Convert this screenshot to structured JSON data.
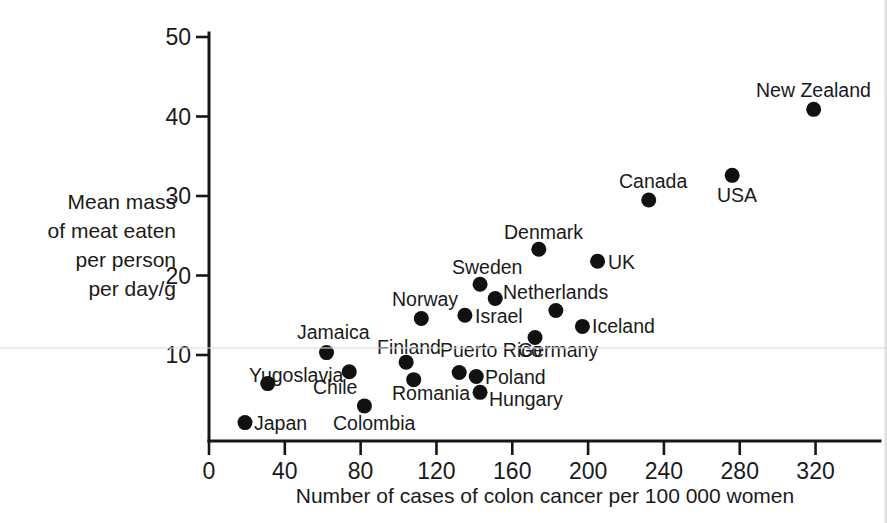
{
  "chart_data": {
    "type": "scatter",
    "title": "",
    "xlabel": "Number of cases of colon cancer per 100 000 women",
    "ylabel": "Mean mass of meat eaten per person per day/g",
    "ylabel_lines": [
      "Mean mass",
      "of meat eaten",
      "per person",
      "per day/g"
    ],
    "xlim": [
      0,
      330
    ],
    "ylim": [
      0,
      50
    ],
    "xticks": [
      0,
      40,
      80,
      120,
      160,
      200,
      240,
      280,
      320
    ],
    "xtick_labels": [
      "0",
      "40",
      "80",
      "120",
      "160",
      "200",
      "240",
      "280",
      "320"
    ],
    "yticks": [
      10,
      20,
      30,
      40,
      50
    ],
    "ytick_labels": [
      "10",
      "20",
      "30",
      "40",
      "50"
    ],
    "grid": false,
    "legend": "none",
    "marker": "filled-circle",
    "marker_color": "#111111",
    "points": [
      {
        "label": "Japan",
        "x": 19,
        "y": 1.5,
        "lx": 254,
        "ly": 430,
        "anchor": "start"
      },
      {
        "label": "Colombia",
        "x": 82,
        "y": 3.6,
        "lx": 333,
        "ly": 430,
        "anchor": "start"
      },
      {
        "label": "Hungary",
        "x": 143,
        "y": 5.3,
        "lx": 489,
        "ly": 406,
        "anchor": "start"
      },
      {
        "label": "Yugoslavia",
        "x": 31,
        "y": 6.4,
        "lx": 249,
        "ly": 382,
        "anchor": "start"
      },
      {
        "label": "Romania",
        "x": 108,
        "y": 6.9,
        "lx": 392,
        "ly": 400,
        "anchor": "start"
      },
      {
        "label": "Poland",
        "x": 141,
        "y": 7.3,
        "lx": 485,
        "ly": 384,
        "anchor": "start"
      },
      {
        "label": "Puerto Rico",
        "x": 132,
        "y": 7.8,
        "lx": 440,
        "ly": 357,
        "anchor": "start"
      },
      {
        "label": "Chile",
        "x": 74,
        "y": 7.9,
        "lx": 313,
        "ly": 394,
        "anchor": "start"
      },
      {
        "label": "Finland",
        "x": 104,
        "y": 9.1,
        "lx": 377,
        "ly": 354,
        "anchor": "start"
      },
      {
        "label": "Jamaica",
        "x": 62,
        "y": 10.3,
        "lx": 297,
        "ly": 339,
        "anchor": "start"
      },
      {
        "label": "Germany",
        "x": 172,
        "y": 12.2,
        "lx": 518,
        "ly": 357,
        "anchor": "start"
      },
      {
        "label": "Iceland",
        "x": 197,
        "y": 13.6,
        "lx": 592,
        "ly": 333,
        "anchor": "start"
      },
      {
        "label": "Norway",
        "x": 112,
        "y": 14.6,
        "lx": 392,
        "ly": 306,
        "anchor": "start"
      },
      {
        "label": "Israel",
        "x": 135,
        "y": 15.0,
        "lx": 475,
        "ly": 323,
        "anchor": "start"
      },
      {
        "label": "Netherlands",
        "x": 183,
        "y": 15.6,
        "lx": 503,
        "ly": 299,
        "anchor": "start"
      },
      {
        "label": "",
        "x": 151,
        "y": 17.1,
        "lx": 0,
        "ly": 0,
        "anchor": "start"
      },
      {
        "label": "Sweden",
        "x": 143,
        "y": 18.9,
        "lx": 452,
        "ly": 274,
        "anchor": "start"
      },
      {
        "label": "UK",
        "x": 205,
        "y": 21.8,
        "lx": 608,
        "ly": 269,
        "anchor": "start"
      },
      {
        "label": "Denmark",
        "x": 174,
        "y": 23.3,
        "lx": 504,
        "ly": 239,
        "anchor": "start"
      },
      {
        "label": "Canada",
        "x": 232,
        "y": 29.5,
        "lx": 619,
        "ly": 188,
        "anchor": "start"
      },
      {
        "label": "USA",
        "x": 276,
        "y": 32.6,
        "lx": 717,
        "ly": 202,
        "anchor": "start"
      },
      {
        "label": "New Zealand",
        "x": 319,
        "y": 40.9,
        "lx": 756,
        "ly": 97,
        "anchor": "start"
      }
    ]
  },
  "axes": {
    "x_axis_title": "Number of cases of colon cancer per 100 000 women",
    "y_axis_title_lines": [
      "Mean mass",
      "of meat eaten",
      "per person",
      "per day/g"
    ]
  }
}
